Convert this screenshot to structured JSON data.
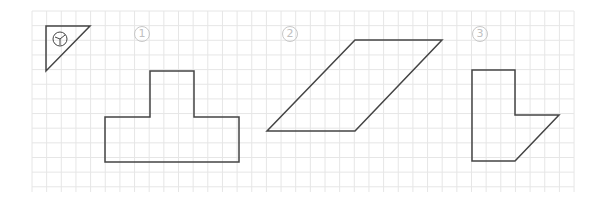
{
  "figure": {
    "type": "grid worksheet with shapes",
    "grid": {
      "x0": 32,
      "y0": 11,
      "x1": 574,
      "y1": 192,
      "spacing": 14.65,
      "color": "#e4e4e4"
    },
    "legend_triangle": {
      "label": "triangle ruler icon"
    },
    "shapes": [
      {
        "label": "1",
        "name": "T-shape"
      },
      {
        "label": "2",
        "name": "parallelogram"
      },
      {
        "label": "3",
        "name": "pentagon L-shape"
      }
    ]
  }
}
